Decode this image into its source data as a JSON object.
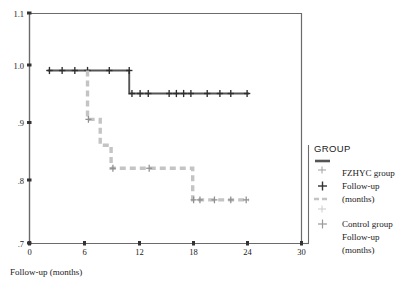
{
  "chart_data": {
    "type": "line",
    "subtype": "kaplan-meier-step",
    "title": "",
    "xlabel": "Follow-up (months)",
    "ylabel": "",
    "xlim": [
      0,
      30
    ],
    "ylim": [
      0.7,
      1.1
    ],
    "xticks": [
      "0",
      "6",
      "12",
      "18",
      "24",
      "30"
    ],
    "xtick_values": [
      0,
      6,
      12,
      18,
      24,
      30
    ],
    "yticks": [
      "1.1",
      "1.0",
      ".9",
      ".8",
      ".7"
    ],
    "ytick_values": [
      1.1,
      1.0,
      0.9,
      0.8,
      0.7
    ],
    "grid": false,
    "legend_position": "right",
    "series": [
      {
        "name": "FZHYC group",
        "color": "#555555",
        "linestyle": "solid",
        "steps_x": [
          2.0,
          11.0,
          11.0,
          24.2
        ],
        "steps_y": [
          1.0,
          1.0,
          0.96,
          0.96
        ],
        "censor_x": [
          2.2,
          3.6,
          5.0,
          6.4,
          8.8,
          11.0,
          11.3,
          12.2,
          13.1,
          15.4,
          16.2,
          17.0,
          17.8,
          19.6,
          21.0,
          22.2,
          24.0
        ],
        "censor_y": [
          1.0,
          1.0,
          1.0,
          1.0,
          1.0,
          1.0,
          0.96,
          0.96,
          0.96,
          0.96,
          0.96,
          0.96,
          0.96,
          0.96,
          0.96,
          0.96,
          0.96
        ]
      },
      {
        "name": "Control group",
        "color": "#c4c4c4",
        "linestyle": "dashed",
        "steps_x": [
          6.4,
          6.4,
          7.8,
          7.8,
          9.0,
          9.0,
          18.0,
          18.0,
          24.2
        ],
        "steps_y": [
          1.0,
          0.915,
          0.915,
          0.87,
          0.87,
          0.83,
          0.83,
          0.775,
          0.775
        ],
        "censor_x": [
          6.5,
          9.2,
          13.2,
          18.1,
          18.8,
          20.4,
          22.2,
          23.9
        ],
        "censor_y": [
          0.915,
          0.83,
          0.83,
          0.775,
          0.775,
          0.775,
          0.775,
          0.775
        ]
      }
    ]
  },
  "legend": {
    "title": "GROUP",
    "entries": [
      {
        "marker": "solid-line",
        "color": "#555555",
        "label": ""
      },
      {
        "marker": "plus-censor",
        "color": "#999999",
        "label": ""
      },
      {
        "marker": "plus-censor",
        "color": "#333333",
        "label": "FZHYC group"
      },
      {
        "marker": "dashed-line",
        "color": "#c4c4c4",
        "label": "Follow-up"
      },
      {
        "marker": "plus-censor",
        "color": "#c8c8c8",
        "label": "(months)"
      },
      {
        "marker": "plus-censor",
        "color": "#9a9a9a",
        "label": "Control group"
      },
      {
        "marker": "none",
        "color": "#1a1a1a",
        "label": "Follow-up"
      },
      {
        "marker": "none",
        "color": "#1a1a1a",
        "label": "(months)"
      }
    ]
  },
  "axis": {
    "xlabel": "Follow-up (months)"
  },
  "colors": {
    "fzhyc_line": "#555555",
    "control_line": "#c4c4c4",
    "axis": "#6b6b6b",
    "text": "#1a1a1a"
  }
}
